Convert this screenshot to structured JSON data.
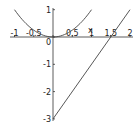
{
  "chart_data": {
    "type": "line",
    "title": "",
    "xlabel": "x",
    "ylabel": "",
    "xlim": [
      -1,
      2
    ],
    "ylim": [
      -3,
      1
    ],
    "grid": false,
    "legend": null,
    "x_ticks": [
      "-1",
      "-0.5",
      "0",
      "0.5",
      "1",
      "1.5",
      "2"
    ],
    "y_ticks": [
      "1",
      "0",
      "-1",
      "-2",
      "-3"
    ],
    "series": [
      {
        "name": "y = x^2",
        "x": [
          -1,
          -0.75,
          -0.5,
          -0.25,
          0,
          0.25,
          0.5,
          0.75,
          1
        ],
        "y": [
          1,
          0.5625,
          0.25,
          0.0625,
          0,
          0.0625,
          0.25,
          0.5625,
          1
        ]
      },
      {
        "name": "y = 2x - 3",
        "x": [
          0,
          2
        ],
        "y": [
          -3,
          1
        ]
      }
    ],
    "color": "#444444"
  }
}
